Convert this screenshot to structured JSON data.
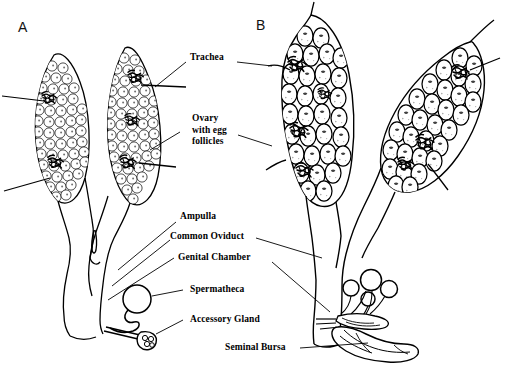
{
  "figure": {
    "background_color": "#ffffff",
    "line_color": "#000000",
    "panels": [
      {
        "id": "A",
        "letter": "A",
        "description": "Previtellogenic ovaries with small undifferentiated egg follicles"
      },
      {
        "id": "B",
        "letter": "B",
        "description": "Vitellogenic ovaries with large mature egg follicles"
      }
    ]
  },
  "labels": [
    {
      "id": "trachea",
      "text": "Trachea",
      "lines": [
        "Trachea"
      ]
    },
    {
      "id": "ovary",
      "text": "Ovary with egg follicles",
      "lines": [
        "Ovary",
        "with egg",
        "follicles"
      ]
    },
    {
      "id": "ampulla",
      "text": "Ampulla",
      "lines": [
        "Ampulla"
      ]
    },
    {
      "id": "common-oviduct",
      "text": "Common Oviduct",
      "lines": [
        "Common Oviduct"
      ]
    },
    {
      "id": "genital-chamber",
      "text": "Genital Chamber",
      "lines": [
        "Genital Chamber"
      ]
    },
    {
      "id": "spermatheca",
      "text": "Spermatheca",
      "lines": [
        "Spermatheca"
      ]
    },
    {
      "id": "accessory-gland",
      "text": "Accessory Gland",
      "lines": [
        "Accessory Gland"
      ]
    },
    {
      "id": "seminal-bursa",
      "text": "Seminal Bursa",
      "lines": [
        "Seminal Bursa"
      ]
    }
  ],
  "label_text": {
    "panel_a": "A",
    "panel_b": "B",
    "trachea": "Trachea",
    "ovary_line1": "Ovary",
    "ovary_line2": "with egg",
    "ovary_line3": "follicles",
    "ampulla": "Ampulla",
    "common_oviduct": "Common Oviduct",
    "genital_chamber": "Genital Chamber",
    "spermatheca": "Spermatheca",
    "accessory_gland": "Accessory Gland",
    "seminal_bursa": "Seminal Bursa"
  },
  "structures": {
    "panel_a": {
      "ovaries": 2,
      "follicle_size": "small",
      "spermathecae": 1,
      "accessory_glands": 1,
      "seminal_bursa": false
    },
    "panel_b": {
      "ovaries": 2,
      "follicle_size": "large",
      "spermathecae": 4,
      "accessory_glands": 1,
      "seminal_bursa": true
    }
  }
}
